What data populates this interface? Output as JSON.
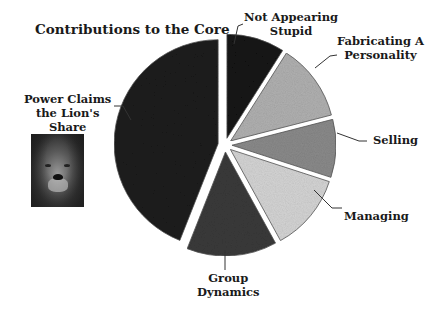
{
  "title": "Contributions to the Core",
  "chart_data": {
    "type": "pie",
    "title": "Contributions to the Core",
    "exploded": true,
    "start_angle_deg": 0,
    "direction": "clockwise",
    "categories": [
      "Not Appearing Stupid",
      "Fabricating A Personality",
      "Selling",
      "Managing",
      "Group Dynamics",
      "Power Claims the Lion's Share"
    ],
    "values": [
      9,
      12,
      9,
      12,
      14,
      44
    ],
    "units": "approximate percent (no data labels shown)",
    "slice_colors": [
      "#141414",
      "#b0b0b0",
      "#8a8a8a",
      "#d4d4d4",
      "#3a3a3a",
      "#1c1c1c"
    ],
    "legend": "none (callout labels)"
  },
  "labels": {
    "stupid": [
      "Not Appearing",
      "Stupid"
    ],
    "personality": [
      "Fabricating A",
      "Personality"
    ],
    "selling": "Selling",
    "managing": "Managing",
    "group": [
      "Group",
      "Dynamics"
    ],
    "power": [
      "Power Claims",
      "the Lion's",
      "Share"
    ]
  },
  "image": {
    "alt": "lion-photo"
  }
}
